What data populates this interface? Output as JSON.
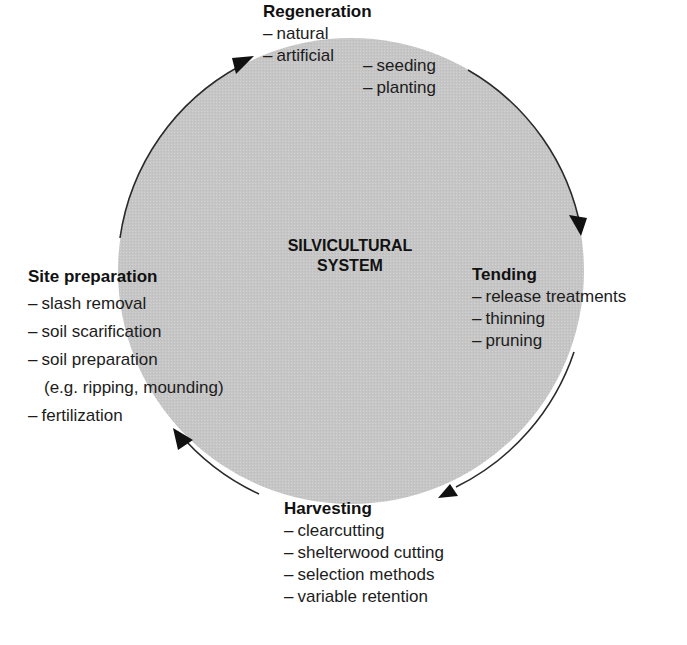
{
  "diagram": {
    "center_label": {
      "line1": "SILVICULTURAL",
      "line2": "SYSTEM"
    },
    "colors": {
      "circle_fill": "#c8c8c8",
      "arc_stroke": "#2a2a2a",
      "text": "#1c1c1c",
      "background": "#ffffff"
    },
    "cycle_direction": "clockwise",
    "stages": {
      "regeneration": {
        "title": "Regeneration",
        "items": [
          "natural",
          "artificial"
        ],
        "sub_items": [
          "seeding",
          "planting"
        ]
      },
      "tending": {
        "title": "Tending",
        "items": [
          "release treatments",
          "thinning",
          "pruning"
        ]
      },
      "harvesting": {
        "title": "Harvesting",
        "items": [
          "clearcutting",
          "shelterwood cutting",
          "selection methods",
          "variable retention"
        ]
      },
      "site_preparation": {
        "title": "Site preparation",
        "items": [
          "slash removal",
          "soil scarification",
          "soil preparation",
          "fertilization"
        ],
        "item_2_continuation": "(e.g. ripping, mounding)"
      }
    },
    "dash": "–"
  }
}
